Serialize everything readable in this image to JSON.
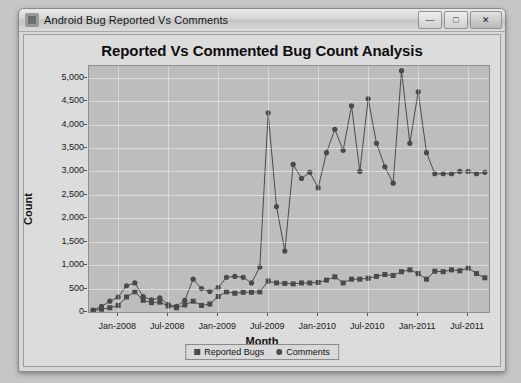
{
  "window": {
    "title": "Android Bug Reported Vs Comments",
    "icon": "app-icon",
    "buttons": {
      "minimize": "—",
      "maximize": "□",
      "close": "✕"
    }
  },
  "chart_data": {
    "type": "line",
    "title": "Reported Vs Commented Bug Count Analysis",
    "xlabel": "Month",
    "ylabel": "Count",
    "ylim": [
      0,
      5250
    ],
    "yticks": [
      0,
      500,
      1000,
      1500,
      2000,
      2500,
      3000,
      3500,
      4000,
      4500,
      5000
    ],
    "ytick_labels": [
      "0",
      "500",
      "1,000",
      "1,500",
      "2,000",
      "2,500",
      "3,000",
      "3,500",
      "4,000",
      "4,500",
      "5,000"
    ],
    "grid": true,
    "legend_position": "bottom-center",
    "xtick_labels": [
      "Jan-2008",
      "Jul-2008",
      "Jan-2009",
      "Jul-2009",
      "Jan-2010",
      "Jul-2010",
      "Jan-2011",
      "Jul-2011"
    ],
    "xtick_indices": [
      3,
      9,
      15,
      21,
      27,
      33,
      39,
      45
    ],
    "x": [
      "Oct-2007",
      "Nov-2007",
      "Dec-2007",
      "Jan-2008",
      "Feb-2008",
      "Mar-2008",
      "Apr-2008",
      "May-2008",
      "Jun-2008",
      "Jul-2008",
      "Aug-2008",
      "Sep-2008",
      "Oct-2008",
      "Nov-2008",
      "Dec-2008",
      "Jan-2009",
      "Feb-2009",
      "Mar-2009",
      "Apr-2009",
      "May-2009",
      "Jun-2009",
      "Jul-2009",
      "Aug-2009",
      "Sep-2009",
      "Oct-2009",
      "Nov-2009",
      "Dec-2009",
      "Jan-2010",
      "Feb-2010",
      "Mar-2010",
      "Apr-2010",
      "May-2010",
      "Jun-2010",
      "Jul-2010",
      "Aug-2010",
      "Sep-2010",
      "Oct-2010",
      "Nov-2010",
      "Dec-2010",
      "Jan-2011",
      "Feb-2011",
      "Mar-2011",
      "Apr-2011",
      "May-2011",
      "Jun-2011",
      "Jul-2011",
      "Aug-2011",
      "Sep-2011"
    ],
    "series": [
      {
        "name": "Reported Bugs",
        "marker": "square",
        "color": "#4a4a4a",
        "values": [
          30,
          60,
          90,
          140,
          320,
          430,
          250,
          200,
          210,
          130,
          90,
          150,
          230,
          140,
          170,
          330,
          430,
          400,
          420,
          420,
          430,
          660,
          620,
          610,
          600,
          620,
          620,
          630,
          680,
          750,
          620,
          700,
          700,
          720,
          760,
          800,
          780,
          860,
          900,
          820,
          700,
          870,
          860,
          900,
          880,
          940,
          820,
          730
        ]
      },
      {
        "name": "Comments",
        "marker": "circle",
        "color": "#4a4a4a",
        "values": [
          40,
          120,
          230,
          320,
          560,
          620,
          330,
          260,
          300,
          160,
          120,
          250,
          700,
          500,
          440,
          520,
          740,
          760,
          740,
          620,
          960,
          4250,
          2250,
          1300,
          3150,
          2850,
          2980,
          2650,
          3400,
          3900,
          3450,
          4400,
          3000,
          4550,
          3600,
          3100,
          2750,
          5150,
          3600,
          4700,
          3400,
          2950,
          2950,
          2950,
          3000,
          3000,
          2950,
          2980
        ]
      }
    ]
  },
  "legend": {
    "items": [
      {
        "label": "Reported Bugs",
        "marker": "square"
      },
      {
        "label": "Comments",
        "marker": "circle"
      }
    ]
  }
}
